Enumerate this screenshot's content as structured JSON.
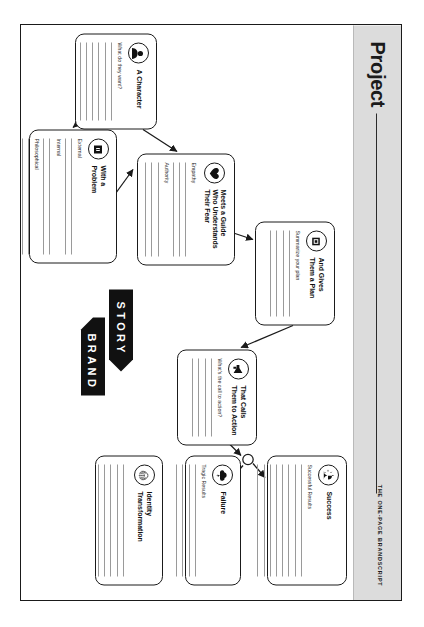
{
  "document": {
    "title": "Project",
    "kicker": "THE ONE-PAGE BRANDSCRIPT"
  },
  "logo": {
    "word_top": "STORY",
    "word_bottom": "BRAND"
  },
  "cards": [
    {
      "id": "character",
      "icon": "person-icon",
      "title": "A Character",
      "fields": [
        {
          "label": "What do they want?",
          "lines": 6
        }
      ]
    },
    {
      "id": "guide",
      "icon": "heart-hands-icon",
      "title": "Meets a Guide\nWho Understands\nTheir Fear",
      "fields": [
        {
          "label": "Empathy",
          "lines": 3
        },
        {
          "label": "Authority",
          "lines": 3
        }
      ]
    },
    {
      "id": "problem",
      "icon": "villain-icon",
      "title": "With a\nProblem",
      "fields": [
        {
          "label": "External",
          "lines": 2
        },
        {
          "label": "Internal",
          "lines": 2
        },
        {
          "label": "Philosophical",
          "lines": 2
        }
      ]
    },
    {
      "id": "plan",
      "icon": "map-icon",
      "title": "And Gives\nThem a Plan",
      "fields": [
        {
          "label": "Summarize your plan",
          "lines": 4
        }
      ]
    },
    {
      "id": "action",
      "icon": "megaphone-icon",
      "title": "That Calls\nThem to Action",
      "fields": [
        {
          "label": "What's the call to action?",
          "lines": 4
        }
      ]
    },
    {
      "id": "success",
      "icon": "sunrise-icon",
      "title": "Success",
      "fields": [
        {
          "label": "Successful Results",
          "lines": 8
        }
      ]
    },
    {
      "id": "failure",
      "icon": "storm-cloud-icon",
      "title": "Failure",
      "fields": [
        {
          "label": "Tragic Results",
          "lines": 4
        }
      ]
    },
    {
      "id": "identity",
      "icon": "fingerprint-icon",
      "title": "Identity\nTransformation",
      "fields": [
        {
          "label": "",
          "lines": 5
        }
      ]
    }
  ],
  "connections": [
    {
      "from": "character",
      "to": "guide"
    },
    {
      "from": "guide",
      "to": "plan"
    },
    {
      "from": "plan",
      "to": "action"
    },
    {
      "from": "action",
      "to": "junction"
    },
    {
      "from": "junction",
      "to": "success"
    },
    {
      "from": "junction",
      "to": "failure"
    },
    {
      "from": "character",
      "to": "problem"
    },
    {
      "from": "problem",
      "to": "guide"
    }
  ],
  "colors": {
    "ink": "#1a1a1a",
    "sidebar": "#dcdcdc",
    "rule": "#9a9a9a",
    "page": "#ffffff"
  }
}
